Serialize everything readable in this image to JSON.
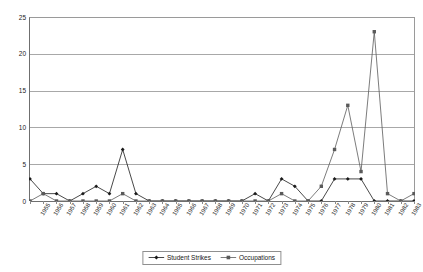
{
  "chart_data": {
    "type": "line",
    "title": "",
    "xlabel": "",
    "ylabel": "",
    "ylim": [
      0,
      25
    ],
    "yticks": [
      0,
      5,
      10,
      15,
      20,
      25
    ],
    "grid": true,
    "legend_position": "bottom",
    "categories": [
      "1955",
      "1956",
      "1957",
      "1958",
      "1959",
      "1960",
      "1961",
      "1962",
      "1963",
      "1964",
      "1965",
      "1966",
      "1967",
      "1968",
      "1969",
      "1970",
      "1971",
      "1972",
      "1973",
      "1974",
      "1975",
      "1976",
      "1977",
      "1978",
      "1979",
      "1980",
      "1981",
      "1982",
      "1983",
      "1984"
    ],
    "series": [
      {
        "name": "Student Strikes",
        "marker": "diamond",
        "color": "#1a1a1a",
        "values": [
          3,
          1,
          1,
          0,
          1,
          2,
          1,
          7,
          1,
          0,
          0,
          0,
          0,
          0,
          0,
          0,
          0,
          1,
          0,
          3,
          2,
          0,
          0,
          3,
          3,
          3,
          0,
          0,
          0,
          0
        ]
      },
      {
        "name": "Occupations",
        "marker": "square",
        "color": "#5a5a5a",
        "values": [
          0,
          1,
          0,
          0,
          0,
          0,
          0,
          1,
          0,
          0,
          0,
          0,
          0,
          0,
          0,
          0,
          0,
          0,
          0,
          1,
          0,
          0,
          2,
          7,
          13,
          4,
          23,
          1,
          0,
          1
        ]
      }
    ]
  },
  "legend": {
    "items": [
      {
        "label": "Student Strikes",
        "marker": "diamond-marker-icon"
      },
      {
        "label": "Occupations",
        "marker": "square-marker-icon"
      }
    ]
  }
}
